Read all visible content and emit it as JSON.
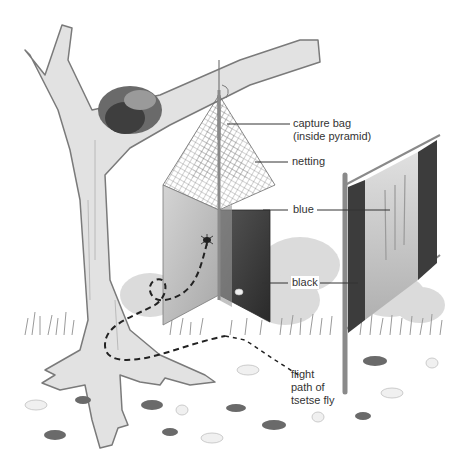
{
  "diagram": {
    "labels": {
      "capture_bag_line1": "capture bag",
      "capture_bag_line2": "(inside pyramid)",
      "netting": "netting",
      "blue": "blue",
      "black": "black",
      "flight_line1": "flight",
      "flight_line2": "path of",
      "flight_line3": "tsetse fly"
    },
    "colors": {
      "background": "#ffffff",
      "trunk_fill": "#e2e2e2",
      "trunk_stroke": "#7a7a7a",
      "blue_panel": "#c4c4c4",
      "black_panel": "#3c3c3c",
      "netting": "#6a6a6a",
      "pole": "#8a8a8a",
      "label_text": "#333333",
      "leader_line": "#333333",
      "flight_path": "#222222"
    }
  }
}
